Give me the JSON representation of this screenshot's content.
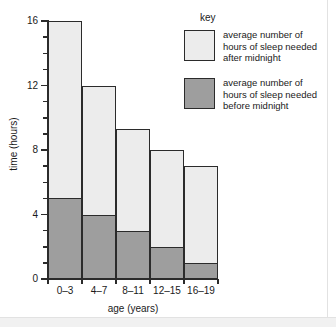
{
  "chart_data": {
    "type": "bar",
    "subtype": "stacked-bar",
    "title": "",
    "xlabel": "age (years)",
    "ylabel": "time (hours)",
    "categories": [
      "0–3",
      "4–7",
      "8–11",
      "12–15",
      "16–19"
    ],
    "series": [
      {
        "name": "average number of hours of sleep needed before midnight",
        "values": [
          5,
          4,
          3,
          2,
          1
        ],
        "color": "#9e9e9e"
      },
      {
        "name": "average number of hours of sleep needed after midnight",
        "values": [
          11,
          8,
          6.3,
          6,
          6
        ],
        "color": "#ececec"
      }
    ],
    "totals": [
      16,
      12,
      9.3,
      8,
      7
    ],
    "ylim": [
      0,
      16
    ],
    "ytick_major": [
      0,
      4,
      8,
      12,
      16
    ],
    "ytick_major_labels": [
      "0",
      "4",
      "8",
      "12",
      "16"
    ],
    "ytick_minor_step": 1,
    "grid": false,
    "legend_position": "top-right"
  },
  "axes": {
    "y_label": "time (hours)",
    "x_label": "age (years)",
    "y_tick_labels": [
      "0",
      "4",
      "8",
      "12",
      "16"
    ],
    "x_tick_labels": [
      "0–3",
      "4–7",
      "8–11",
      "12–15",
      "16–19"
    ]
  },
  "legend": {
    "title": "key",
    "entries": [
      {
        "swatch": "after",
        "label": "average number of\nhours of sleep needed\nafter midnight"
      },
      {
        "swatch": "before",
        "label": "average number of\nhours of sleep needed\nbefore midnight"
      }
    ]
  },
  "colors": {
    "after_midnight": "#ececec",
    "before_midnight": "#9e9e9e",
    "outline": "#2b2b2b",
    "background": "#ffffff"
  }
}
